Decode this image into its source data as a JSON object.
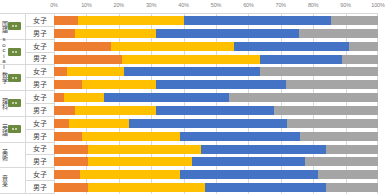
{
  "chart_data": {
    "type": "bar",
    "orientation": "horizontal",
    "stacked": true,
    "normalized_percent": true,
    "title": "",
    "xlabel": "",
    "ylabel": "",
    "xlim": [
      0,
      100
    ],
    "grid": true,
    "legend_position": "none",
    "xticks": [
      "0%",
      "10%",
      "20%",
      "30%",
      "40%",
      "50%",
      "60%",
      "70%",
      "80%",
      "90%",
      "100%"
    ],
    "xtick_values": [
      0,
      10,
      20,
      30,
      40,
      50,
      60,
      70,
      80,
      90,
      100
    ],
    "series": [
      {
        "name": "segment-1",
        "color": "#ed7d31"
      },
      {
        "name": "segment-2",
        "color": "#ffc000"
      },
      {
        "name": "segment-3",
        "color": "#4472c4"
      },
      {
        "name": "segment-4",
        "color": "#a5a5a5"
      }
    ],
    "groups": [
      {
        "label": "国語",
        "badge": true,
        "rows": [
          {
            "sex": "女子",
            "values": [
              7.5,
              32.5,
              45.5,
              14.5
            ]
          },
          {
            "sex": "男子",
            "values": [
              6.5,
              25.0,
              44.0,
              24.5
            ]
          }
        ]
      },
      {
        "label": "social",
        "badge": true,
        "rows": [
          {
            "sex": "女子",
            "values": [
              17.5,
              38.0,
              35.5,
              9.0
            ]
          },
          {
            "sex": "男子",
            "values": [
              21.0,
              42.5,
              25.5,
              11.0
            ]
          }
        ]
      },
      {
        "label": "数学",
        "badge": true,
        "rows": [
          {
            "sex": "女子",
            "values": [
              4.0,
              17.5,
              42.0,
              36.5
            ]
          },
          {
            "sex": "男子",
            "values": [
              8.5,
              23.0,
              40.0,
              28.5
            ]
          }
        ]
      },
      {
        "label": "理科",
        "badge": true,
        "rows": [
          {
            "sex": "女子",
            "values": [
              3.0,
              12.5,
              38.5,
              46.0
            ]
          },
          {
            "sex": "男子",
            "values": [
              6.5,
              25.0,
              36.5,
              32.0
            ]
          }
        ]
      },
      {
        "label": "英語",
        "badge": true,
        "rows": [
          {
            "sex": "女子",
            "values": [
              4.5,
              18.5,
              49.0,
              28.0
            ]
          },
          {
            "sex": "男子",
            "values": [
              8.5,
              30.5,
              37.0,
              24.0
            ]
          }
        ]
      },
      {
        "label": "美術",
        "badge": false,
        "rows": [
          {
            "sex": "女子",
            "values": [
              10.5,
              35.0,
              38.5,
              16.0
            ]
          },
          {
            "sex": "男子",
            "values": [
              10.5,
              32.0,
              35.0,
              22.5
            ]
          }
        ]
      },
      {
        "label": "音楽",
        "badge": false,
        "rows": [
          {
            "sex": "女子",
            "values": [
              8.0,
              31.0,
              42.5,
              18.5
            ]
          },
          {
            "sex": "男子",
            "values": [
              10.5,
              36.0,
              37.5,
              16.0
            ]
          }
        ]
      }
    ]
  }
}
